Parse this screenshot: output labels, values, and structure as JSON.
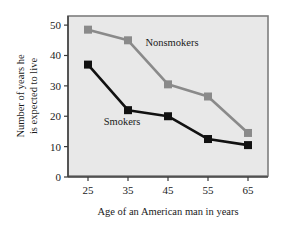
{
  "chart_data": {
    "type": "line",
    "title": "",
    "xlabel": "Age of an American man in years",
    "ylabel": "Number of years he is expected to live",
    "ylabel_line1": "Number of years he",
    "ylabel_line2": "is expected to live",
    "categories": [
      25,
      35,
      45,
      55,
      65
    ],
    "x": [
      25,
      35,
      45,
      55,
      65
    ],
    "xticklabels": [
      "25",
      "35",
      "45",
      "55",
      "65"
    ],
    "yticks": [
      0,
      10,
      20,
      30,
      40,
      50
    ],
    "yticklabels": [
      "0",
      "10",
      "20",
      "30",
      "40",
      "50"
    ],
    "xlim": [
      20,
      70
    ],
    "ylim": [
      0,
      53
    ],
    "grid": false,
    "legend": "inline-annotations",
    "series": [
      {
        "name": "Nonsmokers",
        "color": "#8a8a8a",
        "marker": "square",
        "values": [
          48.5,
          45,
          30.5,
          26.5,
          14.5
        ]
      },
      {
        "name": "Smokers",
        "color": "#111111",
        "marker": "square",
        "values": [
          37,
          22,
          20,
          12.5,
          10.5
        ]
      }
    ],
    "annotations": [
      {
        "text": "Nonsmokers",
        "x": 46,
        "y": 43
      },
      {
        "text": "Smokers",
        "x": 33.5,
        "y": 17
      }
    ],
    "plot_background": "#e8e8e8",
    "plot_border": "#7d7d7d",
    "figure_background": "#ffffff"
  }
}
